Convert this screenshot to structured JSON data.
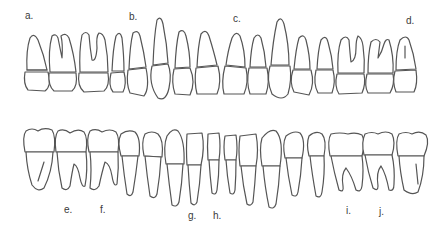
{
  "figure": {
    "upper_labels": [
      {
        "text": "a.",
        "x": 25,
        "y": 10
      },
      {
        "text": "b.",
        "x": 129,
        "y": 11
      },
      {
        "text": "c.",
        "x": 233,
        "y": 13
      },
      {
        "text": "d.",
        "x": 406,
        "y": 15
      }
    ],
    "lower_labels": [
      {
        "text": "e.",
        "x": 64,
        "y": 204
      },
      {
        "text": "f.",
        "x": 100,
        "y": 204
      },
      {
        "text": "g.",
        "x": 188,
        "y": 210
      },
      {
        "text": "h.",
        "x": 213,
        "y": 210
      },
      {
        "text": "i.",
        "x": 346,
        "y": 205
      },
      {
        "text": "j.",
        "x": 379,
        "y": 206
      }
    ],
    "upper_tooth_count": 16,
    "lower_tooth_count": 16
  }
}
